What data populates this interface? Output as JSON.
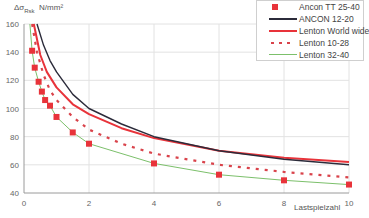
{
  "chart_data": {
    "type": "line",
    "title": "",
    "xlabel": "Lastspielzahl",
    "ylabel": "Δσ_Rsk  N/mm²",
    "ylabel_parts": {
      "symbol": "Δσ",
      "sub": "Rsk",
      "unit": "N/mm²"
    },
    "xlim": [
      0,
      10
    ],
    "ylim": [
      40,
      160
    ],
    "xticks": [
      0,
      2,
      4,
      6,
      8,
      10
    ],
    "yticks": [
      40,
      60,
      80,
      100,
      120,
      140,
      160
    ],
    "grid": true,
    "legend_position": "top-right",
    "series": [
      {
        "name": "Ancon TT 25-40",
        "style": "markers",
        "color": "#e8333a",
        "x": [
          0.25,
          0.33,
          0.45,
          0.55,
          0.65,
          0.8,
          1.0,
          1.5,
          2,
          4,
          6,
          8,
          10
        ],
        "y": [
          141,
          129,
          119,
          112,
          106,
          102,
          94,
          83,
          75,
          61,
          53,
          49,
          46
        ]
      },
      {
        "name": "ANCON 12-20",
        "style": "solid",
        "color": "#2b2b3a",
        "x": [
          0.4,
          0.6,
          0.8,
          1.0,
          1.5,
          2,
          3,
          4,
          6,
          8,
          10
        ],
        "y": [
          160,
          145,
          134,
          126,
          110,
          100,
          89,
          80,
          70,
          64,
          60
        ]
      },
      {
        "name": "Lenton World wide",
        "style": "solid",
        "color": "#e8333a",
        "x": [
          0.3,
          0.5,
          0.7,
          1.0,
          1.5,
          2,
          3,
          4,
          6,
          8,
          10
        ],
        "y": [
          160,
          138,
          126,
          115,
          103,
          96,
          86,
          79,
          70,
          65,
          62
        ]
      },
      {
        "name": "Lenton 10-28",
        "style": "dashed",
        "color": "#d9434b",
        "x": [
          0.25,
          0.4,
          0.6,
          0.8,
          1.0,
          1.5,
          2,
          3,
          4,
          6,
          8,
          10
        ],
        "y": [
          160,
          140,
          124,
          113,
          106,
          94,
          85,
          75,
          68,
          60,
          55,
          51
        ]
      },
      {
        "name": "Lenton 32-40",
        "style": "solid",
        "color": "#7cc06b",
        "x": [
          0.18,
          0.25,
          0.33,
          0.45,
          0.55,
          0.65,
          0.8,
          1.0,
          1.5,
          2,
          4,
          6,
          8,
          10
        ],
        "y": [
          160,
          141,
          129,
          119,
          112,
          106,
          102,
          94,
          83,
          75,
          61,
          53,
          49,
          46
        ]
      }
    ]
  },
  "axes": {
    "x_label": "Lastspielzahl",
    "y_symbol": "Δσ",
    "y_sub": "Rsk",
    "y_unit": "N/mm²"
  },
  "legend": [
    {
      "label": "Ancon TT 25-40"
    },
    {
      "label": "ANCON 12-20"
    },
    {
      "label": "Lenton World wide"
    },
    {
      "label": "Lenton 10-28"
    },
    {
      "label": "Lenton 32-40"
    }
  ]
}
